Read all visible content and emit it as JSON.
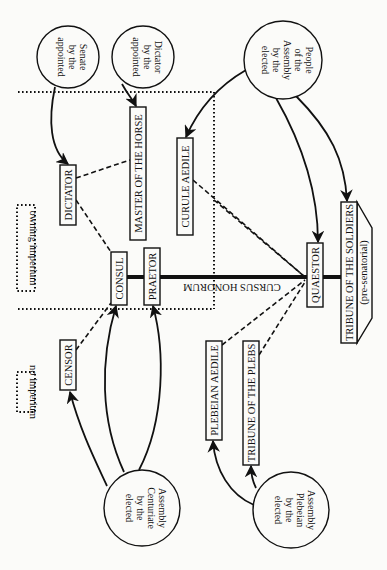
{
  "diagram": {
    "orientation": "rotated 90 degrees clockwise",
    "spine_label": "CURSUS HONORUM",
    "legend": {
      "owning": "owning imperium",
      "none": "no imperium"
    },
    "sources": {
      "senate": [
        "appointed",
        "by the",
        "Senate"
      ],
      "dictator": [
        "appointed",
        "by the",
        "Dictator"
      ],
      "people": [
        "elected",
        "by the",
        "Assembly",
        "of the",
        "People"
      ],
      "centuriate": [
        "elected",
        "by the",
        "Centuriate",
        "Assembly"
      ],
      "plebeian": [
        "elected",
        "by the",
        "Plebeian",
        "Assembly"
      ]
    },
    "offices": {
      "dictator": "DICTATOR",
      "master_of_horse": "MASTER OF THE HORSE",
      "curule_aedile": "CURULE AEDILE",
      "consul": "CONSUL",
      "praetor": "PRAETOR",
      "censor": "CENSOR",
      "plebeian_aedile": "PLEBEIAN AEDILE",
      "tribune_plebs": "TRIBUNE OF THE PLEBS",
      "quaestor": "QUAESTOR",
      "tribune_soldiers": "TRIBUNE OF THE SOLDIERS",
      "tribune_soldiers_note": "(pre-senatorial)"
    },
    "connections": {
      "appointments": [
        {
          "from": "Senate",
          "to": "DICTATOR"
        },
        {
          "from": "Dictator",
          "to": "MASTER OF THE HORSE"
        }
      ],
      "elections": [
        {
          "from": "Assembly of the People",
          "to": "CURULE AEDILE"
        },
        {
          "from": "Assembly of the People",
          "to": "QUAESTOR"
        },
        {
          "from": "Assembly of the People",
          "to": "TRIBUNE OF THE SOLDIERS"
        },
        {
          "from": "Centuriate Assembly",
          "to": "CENSOR"
        },
        {
          "from": "Centuriate Assembly",
          "to": "CONSUL"
        },
        {
          "from": "Centuriate Assembly",
          "to": "PRAETOR"
        },
        {
          "from": "Plebeian Assembly",
          "to": "PLEBEIAN AEDILE"
        },
        {
          "from": "Plebeian Assembly",
          "to": "TRIBUNE OF THE PLEBS"
        }
      ],
      "dashed_links": [
        [
          "DICTATOR",
          "MASTER OF THE HORSE"
        ],
        [
          "DICTATOR",
          "CONSUL"
        ],
        [
          "CENSOR",
          "CONSUL"
        ],
        [
          "CURULE AEDILE",
          "QUAESTOR"
        ],
        [
          "MASTER OF THE HORSE",
          "QUAESTOR"
        ],
        [
          "PLEBEIAN AEDILE",
          "QUAESTOR"
        ],
        [
          "TRIBUNE OF THE PLEBS",
          "QUAESTOR"
        ]
      ],
      "cursus_honorum": [
        "TRIBUNE OF THE SOLDIERS",
        "QUAESTOR",
        "PRAETOR",
        "CONSUL"
      ]
    }
  }
}
